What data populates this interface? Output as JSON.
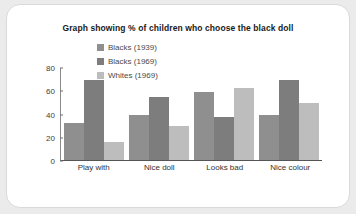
{
  "chart_data": {
    "type": "bar",
    "title": "Graph showing % of children who choose the black doll",
    "xlabel": "",
    "ylabel": "",
    "ylim": [
      0,
      80
    ],
    "yticks": [
      0,
      20,
      40,
      60,
      80
    ],
    "grid": false,
    "legend_position": "top-center",
    "categories": [
      "Play with",
      "Nice doll",
      "Looks bad",
      "Nice colour"
    ],
    "series": [
      {
        "name": "Blacks (1939)",
        "color": "#8f8f8f",
        "values": [
          32,
          39,
          59,
          39
        ]
      },
      {
        "name": "Blacks (1969)",
        "color": "#7d7d7d",
        "values": [
          70,
          55,
          37,
          70
        ]
      },
      {
        "name": "Whites (1969)",
        "color": "#bdbdbd",
        "values": [
          16,
          30,
          63,
          50
        ]
      }
    ]
  },
  "card": {
    "background_color": "#ffffff",
    "border_color": "#d9d9d9"
  },
  "page": {
    "background_color": "#ebebeb"
  }
}
